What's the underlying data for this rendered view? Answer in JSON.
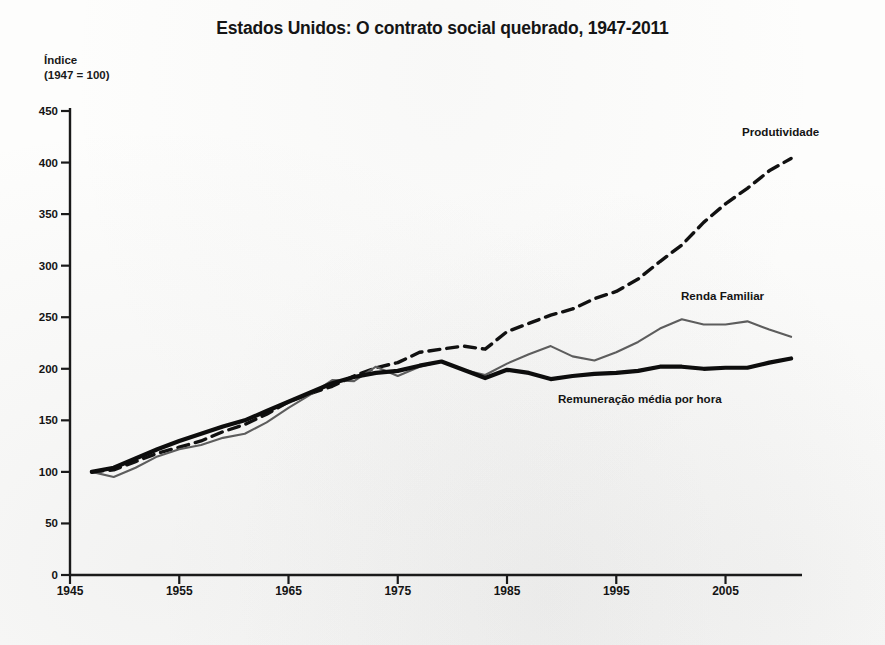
{
  "chart_data": {
    "type": "line",
    "title": "Estados Unidos: O contrato social quebrado, 1947-2011",
    "ylabel_line1": "Índice",
    "ylabel_line2": "(1947 = 100)",
    "xlabel": "",
    "xlim": [
      1945,
      2012
    ],
    "ylim": [
      0,
      450
    ],
    "yticks": [
      450,
      400,
      350,
      300,
      250,
      200,
      150,
      100,
      50,
      0
    ],
    "xticks": [
      1945,
      1955,
      1965,
      1975,
      1985,
      1995,
      2005
    ],
    "grid": false,
    "legend_position": "inline-annotations",
    "annotations": [
      {
        "text": "Produtividade",
        "series": "Produtividade",
        "x": 2006,
        "y": 420
      },
      {
        "text": "Renda Familiar",
        "series": "Renda Familiar",
        "x": 1999,
        "y": 270
      },
      {
        "text": "Remuneração média por hora",
        "series": "Remuneração média por hora",
        "x": 1990,
        "y": 175
      }
    ],
    "series": [
      {
        "name": "Produtividade",
        "style": "dashed",
        "color": "#111111",
        "x": [
          1947,
          1949,
          1951,
          1953,
          1955,
          1957,
          1959,
          1961,
          1963,
          1965,
          1967,
          1969,
          1971,
          1973,
          1975,
          1977,
          1979,
          1981,
          1983,
          1985,
          1987,
          1989,
          1991,
          1993,
          1995,
          1997,
          1999,
          2001,
          2003,
          2005,
          2007,
          2009,
          2011
        ],
        "values": [
          100,
          102,
          110,
          118,
          124,
          130,
          139,
          146,
          156,
          168,
          176,
          183,
          193,
          201,
          206,
          216,
          219,
          222,
          219,
          236,
          244,
          252,
          258,
          268,
          275,
          287,
          304,
          320,
          342,
          360,
          375,
          392,
          404
        ]
      },
      {
        "name": "Renda Familiar",
        "style": "solid-thin",
        "color": "#5d5d5d",
        "x": [
          1947,
          1949,
          1951,
          1953,
          1955,
          1957,
          1959,
          1961,
          1963,
          1965,
          1967,
          1969,
          1971,
          1973,
          1975,
          1977,
          1979,
          1981,
          1983,
          1985,
          1987,
          1989,
          1991,
          1993,
          1995,
          1997,
          1999,
          2001,
          2003,
          2005,
          2007,
          2009,
          2011
        ],
        "values": [
          100,
          95,
          104,
          115,
          122,
          126,
          133,
          137,
          148,
          162,
          175,
          189,
          188,
          202,
          193,
          202,
          207,
          199,
          194,
          205,
          214,
          222,
          212,
          208,
          216,
          226,
          239,
          248,
          243,
          243,
          246,
          238,
          231
        ]
      },
      {
        "name": "Remuneração média por hora",
        "style": "solid-thick",
        "color": "#0d0d0d",
        "x": [
          1947,
          1949,
          1951,
          1953,
          1955,
          1957,
          1959,
          1961,
          1963,
          1965,
          1967,
          1969,
          1971,
          1973,
          1975,
          1977,
          1979,
          1981,
          1983,
          1985,
          1987,
          1989,
          1991,
          1993,
          1995,
          1997,
          1999,
          2001,
          2003,
          2005,
          2007,
          2009,
          2011
        ],
        "values": [
          100,
          104,
          113,
          122,
          130,
          137,
          144,
          150,
          159,
          168,
          177,
          186,
          192,
          196,
          198,
          203,
          207,
          199,
          191,
          199,
          196,
          190,
          193,
          195,
          196,
          198,
          202,
          202,
          200,
          201,
          201,
          206,
          210
        ]
      }
    ]
  }
}
